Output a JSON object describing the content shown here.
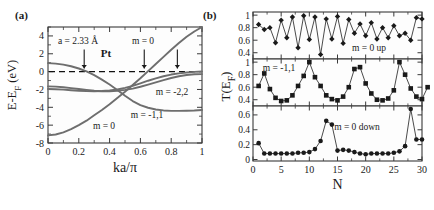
{
  "figure": {
    "panel_a_label": "(a)",
    "panel_b_label": "(b)"
  },
  "panel_a": {
    "xlabel": "ka/π",
    "ylabel_parts": {
      "pre": "E-E",
      "sub": "F",
      "unit": " (eV)"
    },
    "xticks": [
      "0",
      "0.2",
      "0.4",
      "0.6",
      "0.8",
      "1"
    ],
    "yticks": [
      "4",
      "2",
      "0",
      "-2",
      "-4",
      "-6",
      "-8"
    ],
    "annotations": {
      "lattice": "a = 2.33 Å",
      "material": "Pt",
      "band_m0_upper": "m = 0",
      "band_m22": "m = -2,2",
      "band_m11": "m = -1,1",
      "band_m0_lower": "m = 0"
    },
    "arrow_positions": [
      0.235,
      0.625,
      0.84
    ]
  },
  "panel_b": {
    "xlabel": "N",
    "ylabel_parts": {
      "pre": "T(E",
      "sub": "F",
      "post": ")"
    },
    "xticks": [
      "0",
      "5",
      "10",
      "15",
      "20",
      "25",
      "30"
    ],
    "subpanels": [
      {
        "label": "m = 0 up",
        "yticks": [
          "0.4",
          "0.6",
          "0.8",
          "1"
        ]
      },
      {
        "label": "m = -1,1",
        "yticks": [
          "0.4",
          "0.6",
          "0.8",
          "1"
        ]
      },
      {
        "label": "m = 0 down",
        "yticks": [
          "0",
          "0.2",
          "0.4",
          "0.6"
        ]
      }
    ]
  },
  "chart_data": [
    {
      "type": "line",
      "panel": "a",
      "title": "Band structure of Pt monatomic wire",
      "xlabel": "ka/π",
      "ylabel": "E-E_F (eV)",
      "xlim": [
        0,
        1
      ],
      "ylim": [
        -8,
        5
      ],
      "grid": false,
      "legend": "inline-annotations",
      "annotations": [
        "a = 2.33 Å",
        "Pt",
        "m = 0",
        "m = -2,2",
        "m = -1,1",
        "m = 0"
      ],
      "fermi_level_line": 0,
      "arrows_at_x": [
        0.235,
        0.625,
        0.84
      ],
      "x": [
        0,
        0.05,
        0.1,
        0.15,
        0.2,
        0.25,
        0.3,
        0.35,
        0.4,
        0.45,
        0.5,
        0.55,
        0.6,
        0.65,
        0.7,
        0.75,
        0.8,
        0.85,
        0.9,
        0.95,
        1
      ],
      "series": [
        {
          "name": "m = 0 (s-band, lower)",
          "values": [
            -7.15,
            -7.05,
            -6.8,
            -6.45,
            -6.0,
            -5.5,
            -4.9,
            -4.3,
            -3.65,
            -2.95,
            -2.25,
            -1.5,
            -0.75,
            0.05,
            0.85,
            1.65,
            2.45,
            3.2,
            3.9,
            4.5,
            5.0
          ]
        },
        {
          "name": "m = 0 (upper d-band)",
          "values": [
            0.95,
            0.9,
            0.78,
            0.6,
            0.35,
            0.02,
            -0.4,
            -0.9,
            -1.45,
            -2.05,
            -2.7,
            -3.3,
            -3.75,
            -4.05,
            -4.25,
            -4.35,
            -4.4,
            -4.4,
            -4.38,
            -4.35,
            -4.3
          ]
        },
        {
          "name": "m = -1,1",
          "values": [
            -1.65,
            -1.68,
            -1.75,
            -1.85,
            -1.95,
            -2.05,
            -2.15,
            -2.2,
            -2.2,
            -2.15,
            -2.05,
            -1.9,
            -1.7,
            -1.45,
            -1.2,
            -0.95,
            -0.72,
            -0.52,
            -0.38,
            -0.3,
            -0.28
          ]
        },
        {
          "name": "m = -2,2",
          "values": [
            -1.95,
            -1.98,
            -2.02,
            -2.08,
            -2.14,
            -2.18,
            -2.2,
            -2.18,
            -2.12,
            -2.0,
            -1.82,
            -1.6,
            -1.32,
            -1.02,
            -0.75,
            -0.52,
            -0.33,
            -0.2,
            -0.1,
            -0.03,
            0.02
          ]
        }
      ]
    },
    {
      "type": "line",
      "panel": "b-top",
      "title": "m = 0 up",
      "xlabel": "N",
      "ylabel": "T(E_F)",
      "xlim": [
        0,
        30
      ],
      "ylim": [
        0.3,
        1.05
      ],
      "marker": "diamond",
      "grid": false,
      "x": [
        1,
        2,
        3,
        4,
        5,
        6,
        7,
        8,
        9,
        10,
        11,
        12,
        13,
        14,
        15,
        16,
        17,
        18,
        19,
        20,
        21,
        22,
        23,
        24,
        25,
        26,
        27,
        28,
        29,
        30
      ],
      "values": [
        0.85,
        0.77,
        0.8,
        0.56,
        0.92,
        0.64,
        0.97,
        0.48,
        0.99,
        0.61,
        0.97,
        0.37,
        0.94,
        0.62,
        0.98,
        0.55,
        0.93,
        0.71,
        0.86,
        0.67,
        0.88,
        0.62,
        0.8,
        0.64,
        0.83,
        0.67,
        0.71,
        0.6,
        0.96,
        0.94
      ]
    },
    {
      "type": "line",
      "panel": "b-middle",
      "title": "m = -1,1",
      "xlabel": "N",
      "ylabel": "T(E_F)",
      "xlim": [
        0,
        30
      ],
      "ylim": [
        0.3,
        1.05
      ],
      "marker": "square",
      "grid": false,
      "x": [
        1,
        2,
        3,
        4,
        5,
        6,
        7,
        8,
        9,
        10,
        11,
        12,
        13,
        14,
        15,
        16,
        17,
        18,
        19,
        20,
        21,
        22,
        23,
        24,
        25,
        26,
        27,
        28,
        29,
        30
      ],
      "values": [
        0.62,
        0.82,
        0.57,
        0.43,
        0.38,
        0.39,
        0.47,
        0.62,
        0.78,
        1.0,
        0.76,
        0.62,
        0.47,
        0.41,
        0.39,
        0.45,
        0.6,
        0.89,
        0.92,
        0.66,
        0.5,
        0.4,
        0.39,
        0.42,
        0.55,
        1.0,
        0.8,
        0.58,
        0.45,
        0.41,
        0.6
      ]
    },
    {
      "type": "line",
      "panel": "b-bottom",
      "title": "m = 0 down",
      "xlabel": "N",
      "ylabel": "T(E_F)",
      "xlim": [
        0,
        30
      ],
      "ylim": [
        -0.02,
        0.72
      ],
      "marker": "circle",
      "grid": false,
      "x": [
        1,
        2,
        3,
        4,
        5,
        6,
        7,
        8,
        9,
        10,
        11,
        12,
        13,
        14,
        15,
        16,
        17,
        18,
        19,
        20,
        21,
        22,
        23,
        24,
        25,
        26,
        27,
        28,
        29,
        30
      ],
      "values": [
        0.22,
        0.08,
        0.08,
        0.08,
        0.08,
        0.08,
        0.08,
        0.09,
        0.09,
        0.1,
        0.14,
        0.25,
        0.52,
        0.47,
        0.12,
        0.13,
        0.12,
        0.1,
        0.08,
        0.07,
        0.08,
        0.08,
        0.08,
        0.08,
        0.09,
        0.11,
        0.18,
        0.68,
        0.27,
        0.27
      ]
    }
  ]
}
